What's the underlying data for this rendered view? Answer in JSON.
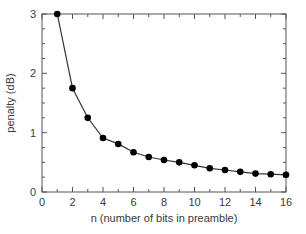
{
  "chart_data": {
    "type": "line",
    "title": "",
    "xlabel": "n (number of bits in preamble)",
    "ylabel": "penalty (dB)",
    "xlim": [
      0,
      16
    ],
    "ylim": [
      0,
      3
    ],
    "xticks": [
      0,
      2,
      4,
      6,
      8,
      10,
      12,
      14,
      16
    ],
    "yticks": [
      0,
      1,
      2,
      3
    ],
    "x_minor_step": 1,
    "y_minor_step": 0.25,
    "grid": false,
    "legend": null,
    "series": [
      {
        "name": "penalty",
        "marker": "filled-circle",
        "color": "#000000",
        "x": [
          1,
          2,
          3,
          4,
          5,
          6,
          7,
          8,
          9,
          10,
          11,
          12,
          13,
          14,
          15,
          16
        ],
        "values": [
          3.0,
          1.75,
          1.25,
          0.91,
          0.81,
          0.67,
          0.59,
          0.54,
          0.5,
          0.45,
          0.4,
          0.37,
          0.34,
          0.31,
          0.3,
          0.29
        ]
      }
    ]
  },
  "colors": {
    "axis": "#555555",
    "line": "#333333",
    "marker": "#000000",
    "text": "#3a3a3a"
  }
}
